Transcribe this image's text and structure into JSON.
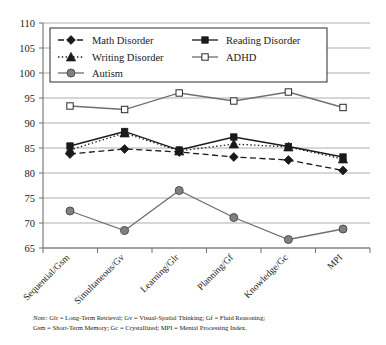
{
  "chart_data": {
    "type": "line",
    "title": "",
    "xlabel": "",
    "ylabel": "",
    "ylim": [
      65,
      110
    ],
    "ytick_step": 5,
    "yticks": [
      65,
      70,
      75,
      80,
      85,
      90,
      95,
      100,
      105,
      110
    ],
    "grid": true,
    "legend_position": "top-left-inside",
    "categories": [
      "Sequential/Gsm",
      "Simultaneous/Gv",
      "Learning/Glr",
      "Planning/Gf",
      "Knowledge/Gc",
      "MPI"
    ],
    "series": [
      {
        "name": "Math Disorder",
        "marker": "filled-diamond",
        "line_style": "dashed",
        "color": "#1a1a1a",
        "values": [
          83.8,
          84.8,
          84.2,
          83.2,
          82.6,
          80.5
        ]
      },
      {
        "name": "Reading Disorder",
        "marker": "filled-square",
        "line_style": "solid",
        "color": "#1a1a1a",
        "values": [
          85.4,
          88.3,
          84.6,
          87.2,
          85.3,
          83.2
        ]
      },
      {
        "name": "Writing Disorder",
        "marker": "filled-triangle",
        "line_style": "dotted",
        "color": "#1a1a1a",
        "values": [
          84.6,
          88.0,
          84.4,
          85.8,
          85.2,
          82.8
        ]
      },
      {
        "name": "ADHD",
        "marker": "open-square",
        "line_style": "solid",
        "color": "#6f6f6f",
        "values": [
          93.4,
          92.7,
          96.0,
          94.4,
          96.2,
          93.1
        ]
      },
      {
        "name": "Autism",
        "marker": "filled-circle",
        "line_style": "solid",
        "color": "#6f6f6f",
        "values": [
          72.4,
          68.5,
          76.5,
          71.1,
          66.7,
          68.8
        ]
      }
    ],
    "annotations": {
      "note_label": "Note:",
      "note_line_1": " Glr = Long-Term Retrieval; Gv = Visual-Spatial Thinking; Gf = Fluid Reasoning;",
      "note_line_2": "Gsm = Short-Term Memory; Gc = Crystallized; MPI = Mental Processing Index."
    }
  },
  "colors": {
    "dark": "#1a1a1a",
    "gray": "#6f6f6f",
    "grid": "#9a9a9a",
    "marker_fill_gray": "#808080",
    "background": "#ffffff"
  }
}
